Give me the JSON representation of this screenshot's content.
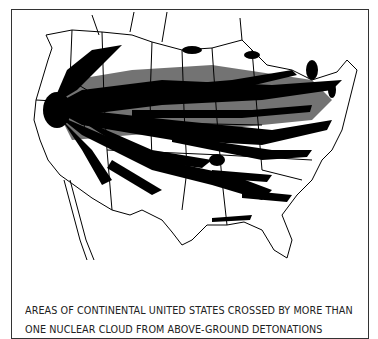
{
  "figure": {
    "caption_lines": [
      "AREAS OF CONTINENTAL UNITED STATES CROSSED BY MORE THAN",
      "ONE NUCLEAR CLOUD FROM ABOVE-GROUND DETONATIONS"
    ],
    "map_subject": "Continental United States with fallout cloud tracks",
    "colors": {
      "ink": "#000000",
      "background": "#ffffff",
      "frame": "#333333"
    }
  }
}
